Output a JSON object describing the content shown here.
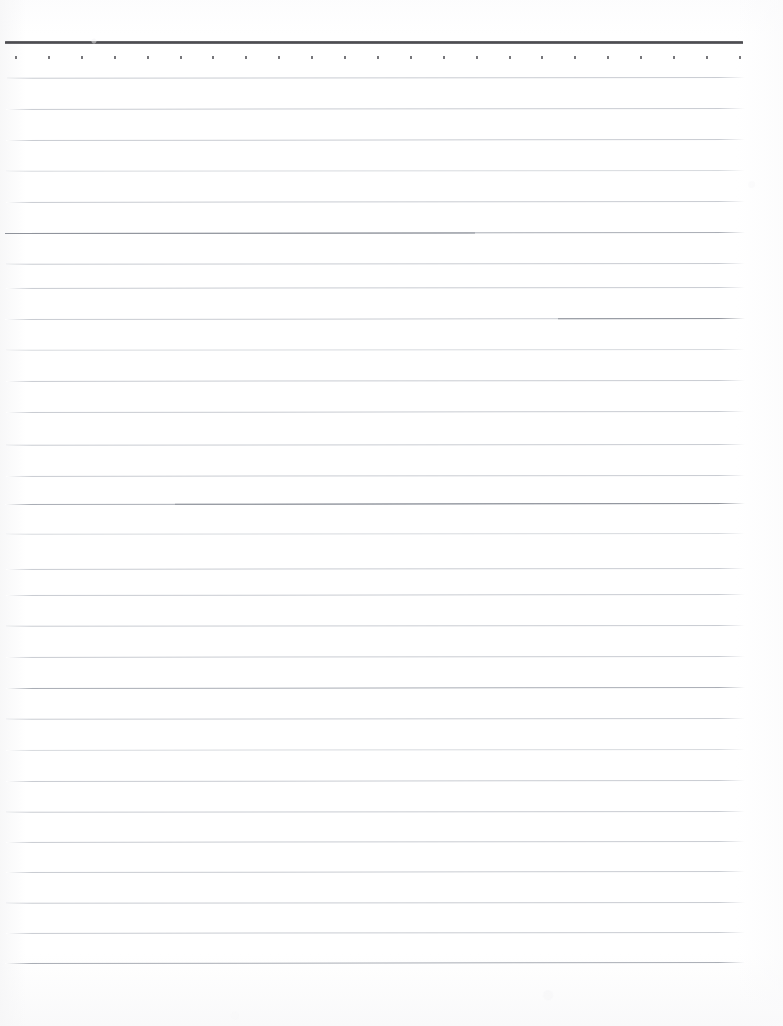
{
  "document": {
    "kind": "scanned-ruled-notepad-page",
    "title": "Blank ruled notepad page",
    "content_text": "",
    "page_width": 783,
    "page_height": 1026,
    "background_color": "#ffffff"
  },
  "header_rule": {
    "name": "top-heavy-rule",
    "x": 5,
    "y": 41,
    "width": 738,
    "height": 3,
    "color": "#4b4b4f"
  },
  "perforation_row": {
    "name": "dot-row",
    "y": 56,
    "first_x": 15,
    "spacing": 32.9,
    "count": 23,
    "dot_color": "#6b6b70",
    "dot_width": 2,
    "dot_height": 3
  },
  "ruled_lines": {
    "color": "#c9ccd2",
    "strong_color": "#a9adb5",
    "faint_color": "#d7dade",
    "left_x": 6,
    "right_x": 746,
    "spacing": 30.6,
    "count": 30,
    "lines": [
      {
        "y": 77,
        "x": 7,
        "width": 738,
        "weight": "normal",
        "dark_from": null,
        "dark_to": null
      },
      {
        "y": 108,
        "x": 6,
        "width": 739,
        "weight": "normal",
        "dark_from": null,
        "dark_to": null
      },
      {
        "y": 139,
        "x": 6,
        "width": 739,
        "weight": "normal",
        "dark_from": null,
        "dark_to": null
      },
      {
        "y": 170,
        "x": 6,
        "width": 739,
        "weight": "faint",
        "dark_from": null,
        "dark_to": null
      },
      {
        "y": 201,
        "x": 6,
        "width": 739,
        "weight": "normal",
        "dark_from": null,
        "dark_to": null
      },
      {
        "y": 232,
        "x": 5,
        "width": 740,
        "weight": "strong",
        "dark_from": 0,
        "dark_to": 470
      },
      {
        "y": 263,
        "x": 6,
        "width": 739,
        "weight": "normal",
        "dark_from": null,
        "dark_to": null
      },
      {
        "y": 287,
        "x": 6,
        "width": 739,
        "weight": "normal",
        "dark_from": null,
        "dark_to": null
      },
      {
        "y": 318,
        "x": 5,
        "width": 740,
        "weight": "normal",
        "dark_from": 553,
        "dark_to": 740
      },
      {
        "y": 349,
        "x": 6,
        "width": 739,
        "weight": "faint",
        "dark_from": null,
        "dark_to": null
      },
      {
        "y": 380,
        "x": 6,
        "width": 739,
        "weight": "normal",
        "dark_from": null,
        "dark_to": null
      },
      {
        "y": 411,
        "x": 6,
        "width": 739,
        "weight": "normal",
        "dark_from": null,
        "dark_to": null
      },
      {
        "y": 444,
        "x": 6,
        "width": 739,
        "weight": "normal",
        "dark_from": null,
        "dark_to": null
      },
      {
        "y": 475,
        "x": 6,
        "width": 739,
        "weight": "normal",
        "dark_from": null,
        "dark_to": null
      },
      {
        "y": 503,
        "x": 5,
        "width": 740,
        "weight": "strong",
        "dark_from": 170,
        "dark_to": 740
      },
      {
        "y": 533,
        "x": 6,
        "width": 739,
        "weight": "faint",
        "dark_from": null,
        "dark_to": null
      },
      {
        "y": 568,
        "x": 6,
        "width": 739,
        "weight": "normal",
        "dark_from": null,
        "dark_to": null
      },
      {
        "y": 594,
        "x": 6,
        "width": 739,
        "weight": "normal",
        "dark_from": null,
        "dark_to": null
      },
      {
        "y": 625,
        "x": 6,
        "width": 739,
        "weight": "normal",
        "dark_from": null,
        "dark_to": null
      },
      {
        "y": 656,
        "x": 6,
        "width": 739,
        "weight": "normal",
        "dark_from": null,
        "dark_to": null
      },
      {
        "y": 687,
        "x": 6,
        "width": 739,
        "weight": "strong",
        "dark_from": null,
        "dark_to": null
      },
      {
        "y": 718,
        "x": 6,
        "width": 739,
        "weight": "normal",
        "dark_from": null,
        "dark_to": null
      },
      {
        "y": 749,
        "x": 6,
        "width": 739,
        "weight": "faint",
        "dark_from": null,
        "dark_to": null
      },
      {
        "y": 780,
        "x": 6,
        "width": 739,
        "weight": "normal",
        "dark_from": null,
        "dark_to": null
      },
      {
        "y": 811,
        "x": 6,
        "width": 739,
        "weight": "normal",
        "dark_from": null,
        "dark_to": null
      },
      {
        "y": 841,
        "x": 6,
        "width": 739,
        "weight": "normal",
        "dark_from": null,
        "dark_to": null
      },
      {
        "y": 871,
        "x": 6,
        "width": 739,
        "weight": "normal",
        "dark_from": null,
        "dark_to": null
      },
      {
        "y": 902,
        "x": 6,
        "width": 739,
        "weight": "normal",
        "dark_from": null,
        "dark_to": null
      },
      {
        "y": 932,
        "x": 6,
        "width": 739,
        "weight": "normal",
        "dark_from": null,
        "dark_to": null
      },
      {
        "y": 962,
        "x": 5,
        "width": 740,
        "weight": "strong",
        "dark_from": null,
        "dark_to": null
      }
    ]
  }
}
